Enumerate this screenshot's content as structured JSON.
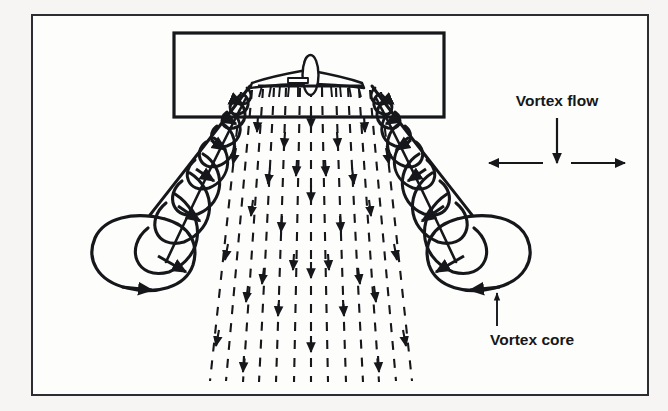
{
  "figure": {
    "kind": "technical-line-diagram",
    "background_color": "#f6f5f3",
    "panel_color": "#fdfdfc",
    "ink_color": "#15171a",
    "outer_frame": {
      "x": 32,
      "y": 15,
      "width": 616,
      "height": 380,
      "stroke_width": 2
    },
    "inner_frame": {
      "x": 174,
      "y": 33,
      "width": 270,
      "height": 84,
      "stroke_width": 3
    }
  },
  "labels": {
    "vortex_flow": "Vortex flow",
    "vortex_core": "Vortex core"
  },
  "annotations": [
    {
      "id": "vortex-flow",
      "text": "Vortex flow",
      "text_x": 557,
      "text_y": 106,
      "leader": {
        "type": "arrow-down",
        "x": 557,
        "y1": 118,
        "y2": 164
      },
      "spread": {
        "type": "double-arrow-horizontal",
        "y": 163,
        "x1": 487,
        "x2": 627
      }
    },
    {
      "id": "vortex-core",
      "text": "Vortex core",
      "text_x": 555,
      "text_y": 341,
      "leader": {
        "type": "arrow-up",
        "x": 497,
        "y1": 325,
        "y2": 292
      }
    }
  ],
  "aircraft": {
    "view": "rear-quarter",
    "fuselage_center_x": 310,
    "fuselage_top_y": 57,
    "wing_span_left_x": 252,
    "wing_span_right_x": 368,
    "wing_y": 80
  },
  "vortices": [
    {
      "side": "left",
      "origin_x": 250,
      "origin_y": 86,
      "cap_cx": 143,
      "cap_cy": 252,
      "cap_rx": 56,
      "cap_ry": 39,
      "coil_count": 9,
      "rotation": "inboard-over-top"
    },
    {
      "side": "right",
      "origin_x": 372,
      "origin_y": 86,
      "cap_cx": 489,
      "cap_cy": 250,
      "cap_rx": 52,
      "cap_ry": 39,
      "coil_count": 9,
      "rotation": "inboard-over-top"
    }
  ],
  "downwash": {
    "style": "dashed-streamlines-with-arrowheads",
    "line_count": 13,
    "top_y": 86,
    "bottom_y": 382,
    "top_half_width": 60,
    "bottom_half_width": 118,
    "center_x": 311
  },
  "icon_names": {
    "arrow_down": "arrow-down-icon",
    "arrow_up": "arrow-up-icon",
    "arrow_left": "arrow-left-icon",
    "arrow_right": "arrow-right-icon",
    "airplane": "airplane-icon",
    "vortex_spiral": "vortex-spiral-icon",
    "downwash_streamlines": "downwash-streamlines-icon"
  }
}
